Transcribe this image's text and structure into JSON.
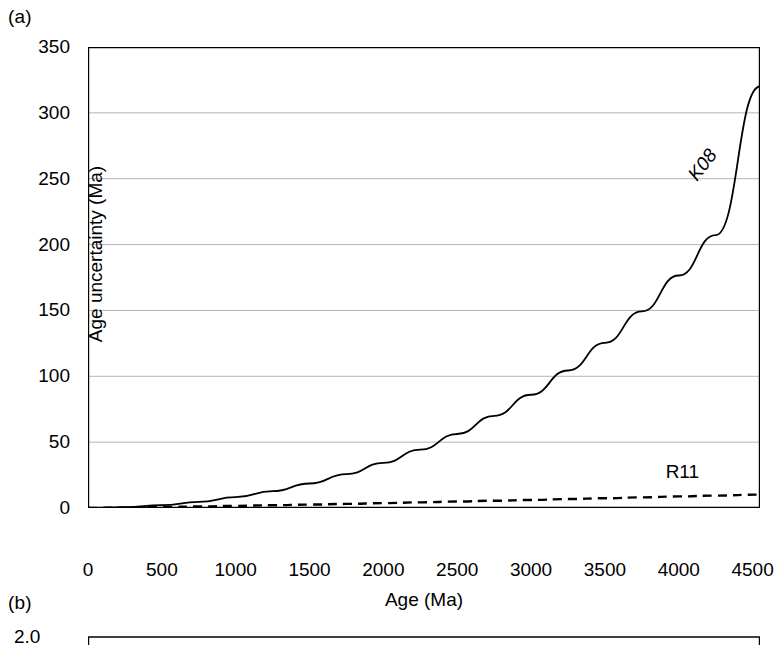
{
  "figure": {
    "panels": [
      {
        "id": "a",
        "label": "(a)"
      },
      {
        "id": "b",
        "label": "(b)"
      }
    ]
  },
  "chart_data": [
    {
      "type": "line",
      "panel": "(a)",
      "title": "",
      "xlabel": "Age (Ma)",
      "ylabel": "Age uncertainty (Ma)",
      "xlim": [
        0,
        4550
      ],
      "ylim": [
        0,
        350
      ],
      "xticks": [
        0,
        500,
        1000,
        1500,
        2000,
        2500,
        3000,
        3500,
        4000,
        4500
      ],
      "xticklabels": [
        "0",
        "500",
        "1000",
        "1500",
        "2000",
        "2500",
        "3000",
        "3500",
        "4000",
        "4500"
      ],
      "yticks": [
        0,
        50,
        100,
        150,
        200,
        250,
        300,
        350
      ],
      "yticklabels": [
        "0",
        "50",
        "100",
        "150",
        "200",
        "250",
        "300",
        "350"
      ],
      "grid": "horizontal",
      "grid_color": "#b4b4b4",
      "legend": "inline-annotations",
      "x": [
        0,
        250,
        500,
        750,
        1000,
        1250,
        1500,
        1750,
        2000,
        2250,
        2500,
        2750,
        3000,
        3250,
        3500,
        3750,
        4000,
        4250,
        4550
      ],
      "series": [
        {
          "name": "K08",
          "style": "solid",
          "color": "#000000",
          "label_text": "K08",
          "label_x": 4150,
          "label_y": 262,
          "values": [
            0,
            0.6,
            2.2,
            4.6,
            8.2,
            12.8,
            18.6,
            25.7,
            34.2,
            44.3,
            56.2,
            70.0,
            86.0,
            104.4,
            125.4,
            149.3,
            176.5,
            207.2,
            320.0
          ]
        },
        {
          "name": "R11",
          "style": "dashed",
          "color": "#000000",
          "label_text": "R11",
          "label_x": 4060,
          "label_y": 28,
          "values": [
            0,
            0.3,
            0.7,
            1.1,
            1.6,
            2.1,
            2.6,
            3.1,
            3.7,
            4.3,
            4.9,
            5.5,
            6.1,
            6.8,
            7.4,
            8.1,
            8.8,
            9.4,
            10.2
          ]
        }
      ]
    },
    {
      "type": "line",
      "panel": "(b)",
      "note": "cropped at image bottom edge",
      "yticks": [
        2.0
      ],
      "yticklabels": [
        "2.0"
      ],
      "ylim_top_visible": 2.0
    }
  ]
}
